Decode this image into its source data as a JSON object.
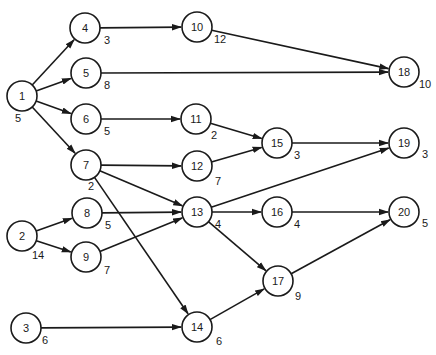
{
  "diagram": {
    "type": "activity-network",
    "node_radius": 15,
    "colors": {
      "stroke": "#1a1a1a",
      "fill": "#ffffff",
      "background": "#ffffff"
    },
    "nodes": [
      {
        "id": "1",
        "label": "1",
        "duration": "5",
        "x": 22,
        "y": 96,
        "dx": -4,
        "dy": 22
      },
      {
        "id": "2",
        "label": "2",
        "duration": "14",
        "x": 22,
        "y": 236,
        "dx": 16,
        "dy": 19
      },
      {
        "id": "3",
        "label": "3",
        "duration": "6",
        "x": 26,
        "y": 328,
        "dx": 19,
        "dy": 12
      },
      {
        "id": "4",
        "label": "4",
        "duration": "3",
        "x": 85,
        "y": 28,
        "dx": 22,
        "dy": 12
      },
      {
        "id": "5",
        "label": "5",
        "duration": "8",
        "x": 86,
        "y": 73,
        "dx": 21,
        "dy": 12
      },
      {
        "id": "6",
        "label": "6",
        "duration": "5",
        "x": 86,
        "y": 119,
        "dx": 21,
        "dy": 12
      },
      {
        "id": "7",
        "label": "7",
        "duration": "2",
        "x": 86,
        "y": 165,
        "dx": 5,
        "dy": 21
      },
      {
        "id": "8",
        "label": "8",
        "duration": "5",
        "x": 87,
        "y": 213,
        "dx": 21,
        "dy": 12
      },
      {
        "id": "9",
        "label": "9",
        "duration": "7",
        "x": 86,
        "y": 257,
        "dx": 21,
        "dy": 13
      },
      {
        "id": "10",
        "label": "10",
        "duration": "12",
        "x": 197,
        "y": 27,
        "dx": 23,
        "dy": 12
      },
      {
        "id": "11",
        "label": "11",
        "duration": "2",
        "x": 196,
        "y": 119,
        "dx": 18,
        "dy": 16
      },
      {
        "id": "12",
        "label": "12",
        "duration": "7",
        "x": 197,
        "y": 166,
        "dx": 21,
        "dy": 15
      },
      {
        "id": "13",
        "label": "13",
        "duration": "4",
        "x": 197,
        "y": 212,
        "dx": 21,
        "dy": 12
      },
      {
        "id": "14",
        "label": "14",
        "duration": "6",
        "x": 197,
        "y": 327,
        "dx": 22,
        "dy": 14
      },
      {
        "id": "15",
        "label": "15",
        "duration": "3",
        "x": 277,
        "y": 143,
        "dx": 20,
        "dy": 12
      },
      {
        "id": "16",
        "label": "16",
        "duration": "4",
        "x": 277,
        "y": 212,
        "dx": 20,
        "dy": 12
      },
      {
        "id": "17",
        "label": "17",
        "duration": "9",
        "x": 278,
        "y": 281,
        "dx": 20,
        "dy": 15
      },
      {
        "id": "18",
        "label": "18",
        "duration": "10",
        "x": 404,
        "y": 72,
        "dx": 21,
        "dy": 12
      },
      {
        "id": "19",
        "label": "19",
        "duration": "3",
        "x": 404,
        "y": 143,
        "dx": 21,
        "dy": 11
      },
      {
        "id": "20",
        "label": "20",
        "duration": "5",
        "x": 404,
        "y": 212,
        "dx": 21,
        "dy": 11
      }
    ],
    "edges": [
      {
        "from": "1",
        "to": "4"
      },
      {
        "from": "1",
        "to": "5"
      },
      {
        "from": "1",
        "to": "6"
      },
      {
        "from": "1",
        "to": "7"
      },
      {
        "from": "4",
        "to": "10"
      },
      {
        "from": "5",
        "to": "18"
      },
      {
        "from": "10",
        "to": "18"
      },
      {
        "from": "6",
        "to": "11"
      },
      {
        "from": "11",
        "to": "15"
      },
      {
        "from": "7",
        "to": "12"
      },
      {
        "from": "12",
        "to": "15"
      },
      {
        "from": "7",
        "to": "13"
      },
      {
        "from": "7",
        "to": "14"
      },
      {
        "from": "15",
        "to": "19"
      },
      {
        "from": "13",
        "to": "19"
      },
      {
        "from": "2",
        "to": "8"
      },
      {
        "from": "2",
        "to": "9"
      },
      {
        "from": "8",
        "to": "13"
      },
      {
        "from": "9",
        "to": "13"
      },
      {
        "from": "13",
        "to": "16"
      },
      {
        "from": "13",
        "to": "17"
      },
      {
        "from": "16",
        "to": "20"
      },
      {
        "from": "17",
        "to": "20"
      },
      {
        "from": "3",
        "to": "14"
      },
      {
        "from": "14",
        "to": "17"
      }
    ]
  }
}
